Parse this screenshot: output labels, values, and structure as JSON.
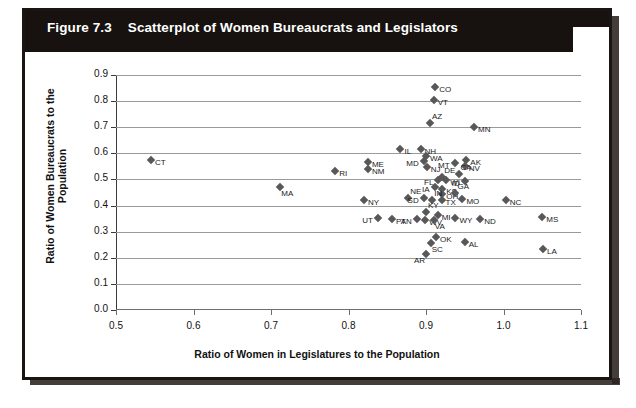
{
  "caption": {
    "number": "Figure 7.3",
    "title": "Scatterplot of Women Bureaucrats and Legislators"
  },
  "chart_data": {
    "type": "scatter",
    "title": "Scatterplot of Women Bureaucrats and Legislators",
    "xlabel": "Ratio of Women in Legislatures to the Population",
    "ylabel": "Ratio of Women Bureaucrats to the Population",
    "xlim": [
      0.5,
      1.1
    ],
    "ylim": [
      0.0,
      0.9
    ],
    "xticks": [
      "0.5",
      "0.6",
      "0.7",
      "0.8",
      "0.9",
      "1.0",
      "1.1"
    ],
    "yticks": [
      "0.0",
      "0.1",
      "0.2",
      "0.3",
      "0.4",
      "0.5",
      "0.6",
      "0.7",
      "0.8",
      "0.9"
    ],
    "grid": "horizontal",
    "legend": "none",
    "marker": "diamond",
    "marker_color": "#58585a",
    "points": [
      {
        "label": "CT",
        "x": 0.545,
        "y": 0.573,
        "pos": "r"
      },
      {
        "label": "RI",
        "x": 0.783,
        "y": 0.533,
        "pos": "r"
      },
      {
        "label": "MA",
        "x": 0.712,
        "y": 0.47,
        "pos": "b"
      },
      {
        "label": "NY",
        "x": 0.82,
        "y": 0.423,
        "pos": "r"
      },
      {
        "label": "UT",
        "x": 0.838,
        "y": 0.352,
        "pos": "l"
      },
      {
        "label": "PA",
        "x": 0.856,
        "y": 0.35,
        "pos": "r"
      },
      {
        "label": "ME",
        "x": 0.825,
        "y": 0.565,
        "pos": "r"
      },
      {
        "label": "NM",
        "x": 0.825,
        "y": 0.54,
        "pos": "r"
      },
      {
        "label": "IL",
        "x": 0.867,
        "y": 0.615,
        "pos": "r"
      },
      {
        "label": "NH",
        "x": 0.893,
        "y": 0.618,
        "pos": "r"
      },
      {
        "label": "WA",
        "x": 0.9,
        "y": 0.59,
        "pos": "r"
      },
      {
        "label": "MD",
        "x": 0.897,
        "y": 0.57,
        "pos": "l"
      },
      {
        "label": "NJ",
        "x": 0.901,
        "y": 0.548,
        "pos": "r"
      },
      {
        "label": "CO",
        "x": 0.912,
        "y": 0.855,
        "pos": "r"
      },
      {
        "label": "VT",
        "x": 0.91,
        "y": 0.805,
        "pos": "r"
      },
      {
        "label": "AZ",
        "x": 0.905,
        "y": 0.718,
        "pos": "t"
      },
      {
        "label": "MN",
        "x": 0.962,
        "y": 0.7,
        "pos": "r"
      },
      {
        "label": "MT",
        "x": 0.937,
        "y": 0.563,
        "pos": "l"
      },
      {
        "label": "AK",
        "x": 0.952,
        "y": 0.575,
        "pos": "r"
      },
      {
        "label": "NV",
        "x": 0.95,
        "y": 0.553,
        "pos": "r"
      },
      {
        "label": "CA",
        "x": 0.942,
        "y": 0.52,
        "pos": "t"
      },
      {
        "label": "DE",
        "x": 0.921,
        "y": 0.51,
        "pos": "t"
      },
      {
        "label": "FL",
        "x": 0.916,
        "y": 0.498,
        "pos": "l"
      },
      {
        "label": "WI",
        "x": 0.926,
        "y": 0.496,
        "pos": "r"
      },
      {
        "label": "ID",
        "x": 0.95,
        "y": 0.493,
        "pos": "l"
      },
      {
        "label": "IA",
        "x": 0.911,
        "y": 0.472,
        "pos": "l"
      },
      {
        "label": "KS",
        "x": 0.921,
        "y": 0.462,
        "pos": "r"
      },
      {
        "label": "OH",
        "x": 0.921,
        "y": 0.446,
        "pos": "r"
      },
      {
        "label": "GA",
        "x": 0.938,
        "y": 0.45,
        "pos": "t"
      },
      {
        "label": "NE",
        "x": 0.877,
        "y": 0.428,
        "pos": "t"
      },
      {
        "label": "SD",
        "x": 0.897,
        "y": 0.428,
        "pos": "l"
      },
      {
        "label": "IN",
        "x": 0.908,
        "y": 0.423,
        "pos": "t"
      },
      {
        "label": "TX",
        "x": 0.92,
        "y": 0.42,
        "pos": "r"
      },
      {
        "label": "MO",
        "x": 0.947,
        "y": 0.425,
        "pos": "r"
      },
      {
        "label": "NC",
        "x": 1.003,
        "y": 0.423,
        "pos": "r"
      },
      {
        "label": "KY",
        "x": 0.9,
        "y": 0.375,
        "pos": "t"
      },
      {
        "label": "MI",
        "x": 0.915,
        "y": 0.362,
        "pos": "r"
      },
      {
        "label": "TN",
        "x": 0.888,
        "y": 0.348,
        "pos": "l"
      },
      {
        "label": "WV",
        "x": 0.899,
        "y": 0.345,
        "pos": "r"
      },
      {
        "label": "VA",
        "x": 0.91,
        "y": 0.345,
        "pos": "b"
      },
      {
        "label": "WY",
        "x": 0.938,
        "y": 0.352,
        "pos": "r"
      },
      {
        "label": "ND",
        "x": 0.97,
        "y": 0.35,
        "pos": "r"
      },
      {
        "label": "MS",
        "x": 1.05,
        "y": 0.358,
        "pos": "r"
      },
      {
        "label": "OK",
        "x": 0.913,
        "y": 0.278,
        "pos": "r"
      },
      {
        "label": "SC",
        "x": 0.906,
        "y": 0.258,
        "pos": "b"
      },
      {
        "label": "AL",
        "x": 0.95,
        "y": 0.262,
        "pos": "r"
      },
      {
        "label": "LA",
        "x": 1.051,
        "y": 0.232,
        "pos": "r"
      },
      {
        "label": "AR",
        "x": 0.9,
        "y": 0.215,
        "pos": "bl"
      }
    ]
  }
}
